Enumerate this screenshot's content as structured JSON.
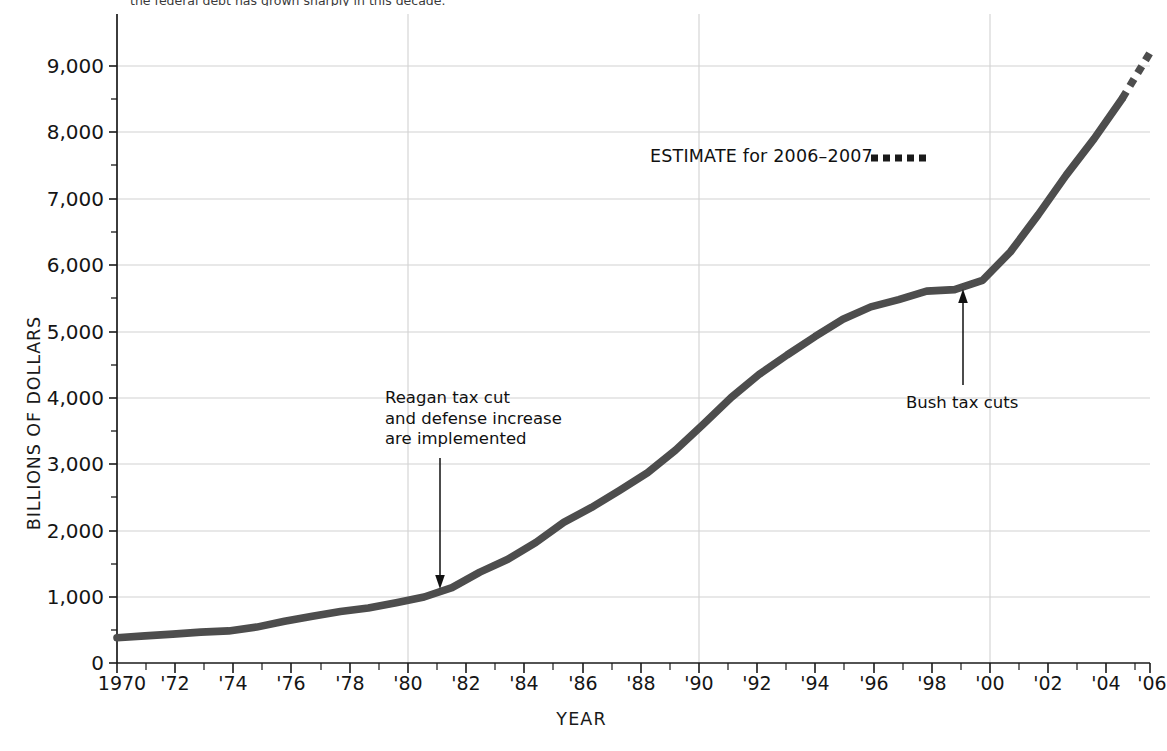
{
  "top_caption": "the federal debt has grown sharply in this decade.",
  "axes": {
    "ylabel": "BILLIONS OF DOLLARS",
    "xlabel": "YEAR",
    "yticks": [
      "0",
      "1,000",
      "2,000",
      "3,000",
      "4,000",
      "5,000",
      "6,000",
      "7,000",
      "8,000",
      "9,000"
    ],
    "xticks": [
      "1970",
      "'72",
      "'74",
      "'76",
      "'78",
      "'80",
      "'82",
      "'84",
      "'86",
      "'88",
      "'90",
      "'92",
      "'94",
      "'96",
      "'98",
      "'00",
      "'02",
      "'04",
      "'06"
    ]
  },
  "annotations": {
    "reagan": "Reagan tax cut and defense increase are implemented",
    "reagan_line1": "Reagan tax cut",
    "reagan_line2": "and defense increase",
    "reagan_line3": "are implemented",
    "bush": "Bush tax cuts",
    "estimate": "ESTIMATE for 2006–2007"
  },
  "colors": {
    "line": "#4a4a4a",
    "grid": "#d2d2d2",
    "axis": "#1a1a1a",
    "text": "#151515"
  },
  "chart_data": {
    "type": "line",
    "title": "",
    "subtitle": "",
    "xlabel": "YEAR",
    "ylabel": "BILLIONS OF DOLLARS",
    "xlim": [
      1970,
      2007
    ],
    "ylim": [
      0,
      9500
    ],
    "ytick_values": [
      0,
      1000,
      2000,
      3000,
      4000,
      5000,
      6000,
      7000,
      8000,
      9000
    ],
    "xtick_values": [
      1970,
      1972,
      1974,
      1976,
      1978,
      1980,
      1982,
      1984,
      1986,
      1988,
      1990,
      1992,
      1994,
      1996,
      1998,
      2000,
      2002,
      2004,
      2006
    ],
    "grid": true,
    "grid_axis": "both",
    "legend": "ESTIMATE for 2006–2007",
    "legend_position": "upper-center",
    "series": [
      {
        "name": "Gross federal debt (actual)",
        "style": "solid",
        "x": [
          1970,
          1971,
          1972,
          1973,
          1974,
          1975,
          1976,
          1977,
          1978,
          1979,
          1980,
          1981,
          1982,
          1983,
          1984,
          1985,
          1986,
          1987,
          1988,
          1989,
          1990,
          1991,
          1992,
          1993,
          1994,
          1995,
          1996,
          1997,
          1998,
          1999,
          2000,
          2001,
          2002,
          2003,
          2004,
          2005,
          2006
        ],
        "values": [
          381,
          408,
          436,
          466,
          484,
          541,
          629,
          706,
          777,
          829,
          909,
          995,
          1137,
          1371,
          1564,
          1817,
          2120,
          2346,
          2601,
          2868,
          3206,
          3598,
          4002,
          4351,
          4643,
          4921,
          5181,
          5369,
          5478,
          5606,
          5629,
          5770,
          6198,
          6760,
          7355,
          7905,
          8507
        ]
      },
      {
        "name": "ESTIMATE for 2006–2007",
        "style": "dashed",
        "x": [
          2006,
          2007
        ],
        "values": [
          8507,
          9200
        ]
      }
    ],
    "annotations": [
      {
        "text": "Reagan tax cut and defense increase are implemented",
        "x": 1982,
        "y": 1050,
        "arrow": "down"
      },
      {
        "text": "Bush tax cuts",
        "x": 2001,
        "y": 5700,
        "arrow": "up"
      }
    ]
  }
}
